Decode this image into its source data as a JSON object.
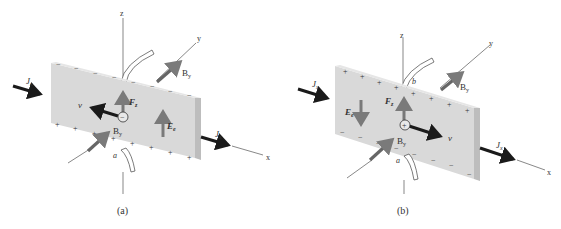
{
  "figure": {
    "panels": [
      {
        "id": "a",
        "caption": "(a)",
        "carrier_charge": "−",
        "top_edge_charge": "−",
        "bottom_edge_charge": "+",
        "velocity_direction": "-x",
        "field_direction": "up",
        "labels": {
          "z_axis": "z",
          "y_axis": "y",
          "x_axis": "x",
          "current_in": "J",
          "current_in_sub": "x",
          "current_out": "J",
          "current_out_sub": "x",
          "b_field_back": "B",
          "b_field_back_sub": "y",
          "b_field_front": "B",
          "b_field_front_sub": "y",
          "force": "F",
          "force_sub": "z",
          "e_field": "E",
          "e_field_sub": "e",
          "velocity": "v",
          "contact_bottom": "a"
        }
      },
      {
        "id": "b",
        "caption": "(b)",
        "carrier_charge": "+",
        "top_edge_charge": "+",
        "bottom_edge_charge": "−",
        "velocity_direction": "+x",
        "field_direction": "down",
        "labels": {
          "z_axis": "z",
          "y_axis": "y",
          "x_axis": "x",
          "current_in": "J",
          "current_in_sub": "x",
          "current_out": "J",
          "current_out_sub": "x",
          "b_field_back": "B",
          "b_field_back_sub": "y",
          "b_field_front": "B",
          "b_field_front_sub": "y",
          "force": "F",
          "force_sub": "z",
          "e_field": "E",
          "e_field_sub": "e",
          "velocity": "v",
          "contact_top": "b",
          "contact_bottom": "a"
        }
      }
    ],
    "colors": {
      "plate_face": "#d9d9d9",
      "plate_edge": "#bdbdbd",
      "dark_arrow": "#1a1a1a",
      "gray_arrow": "#7a7a7a",
      "axis_line": "#555555",
      "text": "#333333"
    }
  }
}
